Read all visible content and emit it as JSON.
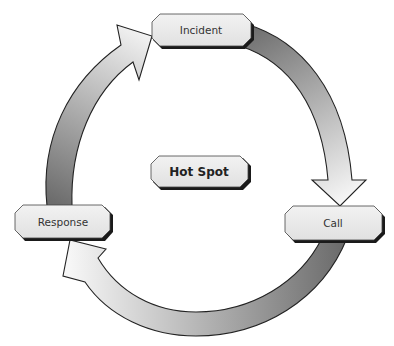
{
  "diagram": {
    "type": "cycle",
    "center": {
      "label": "Hot Spot"
    },
    "nodes": [
      {
        "id": "incident",
        "label": "Incident"
      },
      {
        "id": "call",
        "label": "Call"
      },
      {
        "id": "response",
        "label": "Response"
      }
    ],
    "edges": [
      {
        "from": "incident",
        "to": "call",
        "direction": "clockwise"
      },
      {
        "from": "call",
        "to": "response",
        "direction": "clockwise"
      },
      {
        "from": "response",
        "to": "incident",
        "direction": "clockwise"
      }
    ],
    "colors": {
      "arrow_dark": "#7a7a7a",
      "arrow_light": "#f4f4f4",
      "box_fill": "#e9e9e9",
      "outline": "#222222",
      "shadow": "#1a1a1a"
    }
  }
}
